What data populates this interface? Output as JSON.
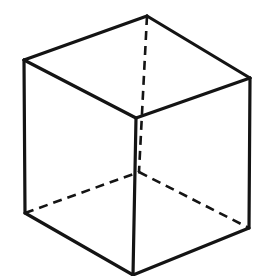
{
  "figure": {
    "name": "necker-cube",
    "background_color": "#ffffff",
    "line_color": "#141414",
    "face_color": "#ffffff",
    "solid_stroke_width": 3.2,
    "dashed_stroke_width": 2.6,
    "dash_pattern": "9 6",
    "canvas": {
      "width": 271,
      "height": 276
    },
    "vertices": {
      "back_top_center": {
        "x": 147,
        "y": 16,
        "label": "back-top-center"
      },
      "top_left": {
        "x": 24,
        "y": 60,
        "label": "top-left"
      },
      "top_right": {
        "x": 250,
        "y": 78,
        "label": "top-right"
      },
      "front_top_center": {
        "x": 136,
        "y": 118,
        "label": "front-top-center"
      },
      "back_bottom_center": {
        "x": 139,
        "y": 172,
        "label": "back-bottom-center-hidden"
      },
      "bottom_left": {
        "x": 25,
        "y": 213,
        "label": "bottom-left"
      },
      "bottom_right": {
        "x": 249,
        "y": 228,
        "label": "bottom-right"
      },
      "front_bottom_center": {
        "x": 133,
        "y": 275,
        "label": "front-bottom-center"
      }
    },
    "edges_solid": [
      {
        "name": "top-face-back-left",
        "d": "M 24 60 L 147 16"
      },
      {
        "name": "top-face-back-right",
        "d": "M 147 16 L 250 78"
      },
      {
        "name": "top-face-front-left",
        "d": "M 24 60 L 136 118"
      },
      {
        "name": "top-face-front-right",
        "d": "M 136 118 L 250 78"
      },
      {
        "name": "left-vertical-edge",
        "d": "M 24 60 L 25 213"
      },
      {
        "name": "right-vertical-edge",
        "d": "M 250 78 L 249 228"
      },
      {
        "name": "center-front-vertical-edge",
        "d": "M 136 118 L 133 275"
      },
      {
        "name": "bottom-face-front-left",
        "d": "M 25 213 L 133 275"
      },
      {
        "name": "bottom-face-front-right",
        "d": "M 133 275 L 249 228"
      }
    ],
    "edges_dashed": [
      {
        "name": "back-vertical-hidden-edge",
        "d": "M 147 16 L 139 172"
      },
      {
        "name": "bottom-face-back-left-hidden",
        "d": "M 25 213 L 139 172"
      },
      {
        "name": "bottom-face-back-right-hidden",
        "d": "M 139 172 L 249 228"
      }
    ]
  }
}
